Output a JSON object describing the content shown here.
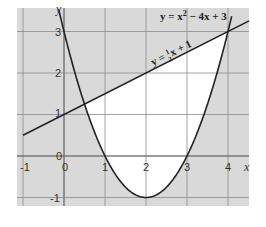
{
  "chart_data": {
    "type": "line",
    "title": "",
    "xlabel": "x",
    "ylabel": "y",
    "xlim": [
      -1.15,
      4.5
    ],
    "ylim": [
      -1.2,
      3.6
    ],
    "grid": true,
    "x_ticks": [
      "-1",
      "0",
      "1",
      "2",
      "3",
      "4"
    ],
    "y_ticks": [
      "-1",
      "0",
      "1",
      "2",
      "3"
    ],
    "origin_label": "0",
    "series": [
      {
        "name": "y = x² − 4x + 3",
        "type": "curve",
        "equation": "x^2 - 4x + 3",
        "x": [
          -0.1,
          0,
          0.5,
          1,
          1.5,
          2,
          2.5,
          3,
          3.5,
          4,
          4.05
        ],
        "values": [
          3.41,
          3,
          1.25,
          0,
          -0.75,
          -1,
          -0.75,
          0,
          1.25,
          3,
          3.2
        ]
      },
      {
        "name": "y = ½x + 1",
        "type": "line",
        "equation": "0.5x + 1",
        "x": [
          -1,
          4.5
        ],
        "values": [
          0.5,
          3.25
        ]
      }
    ],
    "shaded_region": {
      "description": "Region between line and parabola left unshaded (white), rest of grid shaded grey",
      "x_range": [
        0.5,
        4
      ],
      "intersections": [
        [
          0.5,
          1.25
        ],
        [
          4,
          3
        ]
      ]
    },
    "annotations": [
      {
        "text_main": "y = x",
        "sup": "2",
        "text_rest": " − 4x + 3",
        "position": "top-right"
      },
      {
        "text_main": "y = ",
        "frac_num": "1",
        "frac_den": "2",
        "text_rest": "x + 1",
        "position": "along line"
      }
    ]
  },
  "labels": {
    "x_axis": "x",
    "y_axis": "y",
    "origin": "0",
    "tick_x": [
      "-1",
      "0",
      "1",
      "2",
      "3",
      "4"
    ],
    "tick_y_neg1": "-1",
    "tick_y_1": "1",
    "tick_y_2": "2",
    "tick_y_3": "3",
    "parabola_eq_a": "y = x",
    "parabola_eq_sup": "2",
    "parabola_eq_b": " − 4x + 3",
    "line_eq_a": "y = ",
    "line_eq_num": "1",
    "line_eq_den": "2",
    "line_eq_b": "x + 1"
  },
  "colors": {
    "shade": "#d9d9d9",
    "grid": "#8a8a8a",
    "curve": "#222222",
    "unshaded": "#ffffff"
  }
}
